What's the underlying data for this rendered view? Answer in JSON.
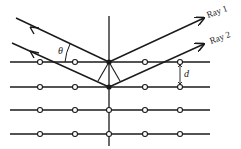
{
  "diagram": {
    "labels": {
      "ray1": "Ray 1",
      "ray2": "Ray 2",
      "angle": "θ",
      "spacing": "d"
    },
    "lattice": {
      "rows_y": [
        62,
        87,
        110,
        134
      ],
      "atom_x": [
        40,
        75,
        109,
        145,
        180
      ],
      "line_x_start": 10,
      "line_x_end": 210
    },
    "colors": {
      "ink": "#1a1a1a",
      "background": "#ffffff"
    }
  }
}
